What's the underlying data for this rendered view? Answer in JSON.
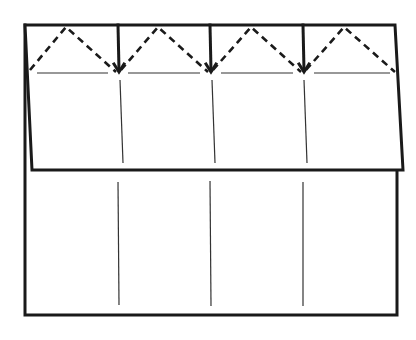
{
  "diagram": {
    "colors": {
      "line": "#1a1a1a",
      "crease": "#333333",
      "background": "#ffffff"
    },
    "sheet": {
      "left": 25,
      "top": 25,
      "right": 397,
      "bottom": 315
    },
    "flap": {
      "top_left": [
        25,
        25
      ],
      "top_right": [
        395,
        25
      ],
      "bottom_right": [
        403,
        170
      ],
      "bottom_left": [
        32,
        170
      ]
    },
    "mountain_folds_x": [
      118,
      210,
      303
    ],
    "valley_peaks_x": [
      72,
      164,
      257,
      350
    ],
    "valley_base_y": 72,
    "flap_creases_x": [
      121,
      212,
      305
    ],
    "lower_creases_x": [
      118,
      210,
      303
    ]
  }
}
